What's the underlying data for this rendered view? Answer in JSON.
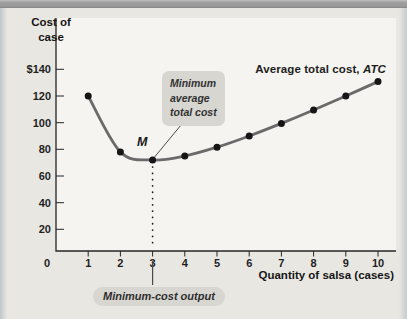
{
  "figure": {
    "y_axis_title": "Cost of\ncase",
    "x_axis_title": "Quantity of salsa (cases)",
    "curve_label_prefix": "Average total cost, ",
    "curve_label_symbol": "ATC",
    "annotations": {
      "min_point_label": "M",
      "min_avg_cost_callout": "Minimum\naverage\ntotal cost",
      "min_cost_output_callout": "Minimum-cost output"
    }
  },
  "chart_data": {
    "type": "line",
    "title": "",
    "xlabel": "Quantity of salsa (cases)",
    "ylabel": "Cost of case",
    "x": [
      1,
      2,
      3,
      4,
      5,
      6,
      7,
      8,
      9,
      10
    ],
    "series": [
      {
        "name": "Average total cost, ATC",
        "values": [
          120,
          78,
          72,
          75,
          81.6,
          90,
          99.43,
          109.5,
          120,
          130.8
        ]
      }
    ],
    "x_tick_labels": [
      "1",
      "2",
      "3",
      "4",
      "5",
      "6",
      "7",
      "8",
      "9",
      "10"
    ],
    "y_ticks": [
      {
        "label": "$140",
        "value": 140
      },
      {
        "label": "120",
        "value": 120
      },
      {
        "label": "100",
        "value": 100
      },
      {
        "label": "80",
        "value": 80
      },
      {
        "label": "60",
        "value": 60
      },
      {
        "label": "40",
        "value": 40
      },
      {
        "label": "20",
        "value": 20
      }
    ],
    "origin_label": "0",
    "xlim": [
      0,
      10.5
    ],
    "ylim": [
      0,
      150
    ],
    "grid": false,
    "legend_position": "top-right-inline",
    "marker": "filled-circle",
    "min_point": {
      "x": 3,
      "value": 72,
      "label": "M"
    },
    "colors": {
      "curve": "#6a6a6a",
      "points": "#151515",
      "axis": "#262626",
      "plot_bg": "#f5f4f0",
      "page_bg": "#e9e7e2",
      "callout_bg": "#d8d6d1",
      "text": "#1f1f1f"
    }
  }
}
